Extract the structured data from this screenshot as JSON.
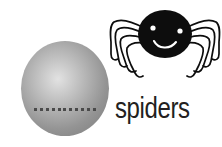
{
  "canvas": {
    "width": 222,
    "height": 147,
    "background_color": "#ffffff"
  },
  "word_card": {
    "label": "spiders",
    "label_color": "#231f20"
  },
  "sphere": {
    "name": "gray-ball",
    "highlight_color": "#e2e2e2",
    "mid_color": "#b2b2b2",
    "edge_color": "#8d8d8d",
    "seam_dot_color": "#4a4a4a",
    "seam_dot_count": 11
  },
  "spider": {
    "name": "cartoon-spider",
    "body_color": "#0d0d0d",
    "eye_color": "#ffffff",
    "mouth_color": "#ffffff",
    "leg_color": "#0d0d0d",
    "leg_count": 8,
    "legs_left": 4,
    "legs_right": 4
  }
}
